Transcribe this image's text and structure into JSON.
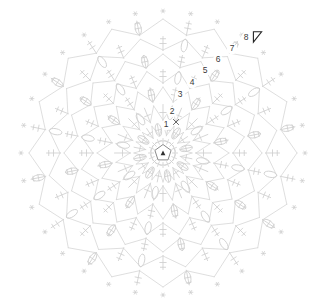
{
  "document": {
    "title": "Crochet Round Motif Chart",
    "type": "circular-crochet-diagram",
    "background_color": "#ffffff"
  },
  "colors": {
    "stitch_stroke": "#cfcfcf",
    "stitch_stroke_soft": "#d6d6d6",
    "edge_marker": "#cccccc",
    "label_text": "#3a3a3a",
    "center_ring": "#8a8a8a",
    "center_dot": "#2e2e2e",
    "start_marker_stroke": "#242424",
    "start_marker_fill": "#ffffff"
  },
  "geometry": {
    "width": 322,
    "height": 307,
    "center_x": 163,
    "center_y": 153,
    "outer_radius": 142,
    "sectors": 16,
    "rounds": 8,
    "round_radii": [
      16,
      31,
      50,
      68,
      85,
      101,
      118,
      136
    ]
  },
  "round_labels": [
    {
      "text": "1",
      "x": 166,
      "y": 125
    },
    {
      "text": "2",
      "x": 172,
      "y": 112
    },
    {
      "text": "3",
      "x": 180,
      "y": 95
    },
    {
      "text": "4",
      "x": 192,
      "y": 83
    },
    {
      "text": "5",
      "x": 205,
      "y": 71
    },
    {
      "text": "6",
      "x": 218,
      "y": 60
    },
    {
      "text": "7",
      "x": 232,
      "y": 49
    },
    {
      "text": "8",
      "x": 246,
      "y": 38
    }
  ],
  "markers": {
    "start_marker": {
      "name": "round-start-arrow",
      "x": 257,
      "y": 37,
      "shape": "triangle-outline"
    },
    "center": {
      "name": "magic-ring",
      "x": 163,
      "y": 153,
      "shape": "pentagon-with-dot"
    },
    "slip_stitch_x": {
      "name": "slip-stitch-cross",
      "x": 176,
      "y": 122
    }
  },
  "legend_symbols": [
    {
      "name": "chain-oval",
      "label": "chain space (oval)"
    },
    {
      "name": "double-crochet-bar",
      "label": "double crochet (bar with crossbar)"
    },
    {
      "name": "edge-star",
      "label": "picot / edge marker (star)"
    },
    {
      "name": "v-stitch",
      "label": "increase V stitch"
    },
    {
      "name": "magic-ring",
      "label": "magic ring center"
    },
    {
      "name": "start-arrow",
      "label": "round start direction"
    }
  ],
  "chart_data": {
    "type": "diagram",
    "subtype": "radial-stitch-chart",
    "sectors": 16,
    "rounds": 8,
    "round_numbers": [
      "1",
      "2",
      "3",
      "4",
      "5",
      "6",
      "7",
      "8"
    ],
    "round_radii": [
      16,
      31,
      50,
      68,
      85,
      101,
      118,
      136
    ],
    "stitches_per_round": [
      8,
      16,
      16,
      16,
      16,
      16,
      16,
      16
    ]
  }
}
